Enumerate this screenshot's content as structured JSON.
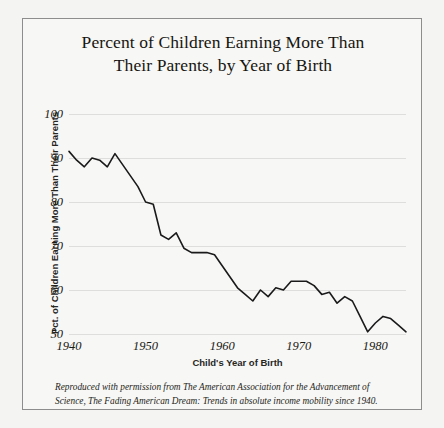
{
  "figure": {
    "title_line1": "Percent of Children Earning More Than",
    "title_line2": "Their Parents, by Year of Birth",
    "caption_line1": "Reproduced with permission from The American Association for the Advancement of",
    "caption_line2": "Science, The Fading American Dream: Trends in absolute income mobility since 1940.",
    "frame_color": "#8d8d8d",
    "background_color": "#f4f4f3",
    "line_color": "#1a1a1a",
    "gridline_color": "#dededd"
  },
  "chart_data": {
    "type": "line",
    "title": "Percent of Children Earning More Than Their Parents, by Year of Birth",
    "xlabel": "Child's Year of Birth",
    "ylabel": "Pct. of Children Earning More Than Their Parents",
    "xlim": [
      1940,
      1984
    ],
    "ylim": [
      50,
      100
    ],
    "xticks": [
      1940,
      1950,
      1960,
      1970,
      1980
    ],
    "xtick_labels": [
      "1940",
      "1950",
      "1960",
      "1970",
      "1980"
    ],
    "yticks": [
      50,
      60,
      70,
      80,
      90,
      100
    ],
    "ytick_labels": [
      "50",
      "60",
      "70",
      "80",
      "90",
      "100"
    ],
    "grid": true,
    "legend": false,
    "series": [
      {
        "name": "Pct. of children earning more than their parents",
        "x": [
          1940,
          1941,
          1942,
          1943,
          1944,
          1945,
          1946,
          1947,
          1948,
          1949,
          1950,
          1951,
          1952,
          1953,
          1954,
          1955,
          1956,
          1957,
          1958,
          1959,
          1960,
          1961,
          1962,
          1963,
          1964,
          1965,
          1966,
          1967,
          1968,
          1969,
          1970,
          1971,
          1972,
          1973,
          1974,
          1975,
          1976,
          1977,
          1978,
          1979,
          1980,
          1981,
          1982,
          1983,
          1984
        ],
        "values": [
          91.5,
          89.5,
          88.0,
          90.0,
          89.5,
          88.0,
          91.0,
          88.5,
          86.0,
          83.5,
          80.0,
          79.5,
          72.5,
          71.5,
          73.0,
          69.5,
          68.5,
          68.5,
          68.5,
          68.0,
          65.5,
          63.0,
          60.5,
          59.0,
          57.5,
          60.0,
          58.5,
          60.5,
          60.0,
          62.0,
          62.0,
          62.0,
          61.0,
          59.0,
          59.5,
          57.0,
          58.5,
          57.5,
          54.0,
          50.5,
          52.5,
          54.0,
          53.5,
          52.0,
          50.5
        ]
      }
    ]
  },
  "axes": {
    "x_title": "Child's Year of Birth",
    "y_title": "Pct. of Children Earning More Than Their Parents"
  }
}
